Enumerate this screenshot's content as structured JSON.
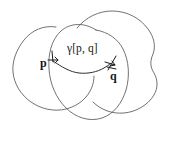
{
  "figure": {
    "domain_type": "diagram",
    "canvas": {
      "width": 170,
      "height": 142,
      "background": "#ffffff"
    },
    "stroke_color": "#585858",
    "curve_color": "#2e2e2e",
    "text_color": "#171717",
    "labels": {
      "point_p": "p",
      "point_q": "q",
      "geodesic": "γ[p, q]"
    },
    "points": {
      "p": {
        "x": 52,
        "y": 60
      },
      "q": {
        "x": 110,
        "y": 66
      }
    },
    "shapes": [
      {
        "name": "left-region",
        "kind": "blob",
        "cx": 52,
        "cy": 67,
        "rx": 43,
        "ry": 40
      },
      {
        "name": "right-region",
        "kind": "blob",
        "cx": 118,
        "cy": 57,
        "rx": 45,
        "ry": 45
      },
      {
        "name": "center-region",
        "kind": "circle",
        "cx": 88,
        "cy": 67,
        "rx": 40,
        "ry": 46
      }
    ]
  }
}
